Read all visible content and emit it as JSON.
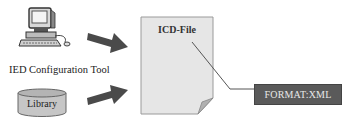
{
  "diagram": {
    "nodes": {
      "tool": {
        "label": "IED Configuration Tool",
        "icon": "computer-icon"
      },
      "library": {
        "label": "Library",
        "icon": "database-cylinder"
      },
      "file": {
        "label": "ICD-File",
        "icon": "document-page"
      },
      "format": {
        "label": "FORMAT:XML"
      }
    },
    "edges": [
      {
        "from": "tool",
        "to": "file",
        "style": "block-arrow"
      },
      {
        "from": "library",
        "to": "file",
        "style": "block-arrow"
      },
      {
        "from": "file",
        "to": "format",
        "style": "callout-line"
      }
    ],
    "colors": {
      "arrow": "#4a4a4a",
      "document_fill": "#e6e6e6",
      "document_border": "#9a9a9a",
      "cylinder_fill": "#c8c8c8",
      "format_box_fill": "#5a5a5a",
      "format_box_text": "#e8e8e8"
    }
  }
}
